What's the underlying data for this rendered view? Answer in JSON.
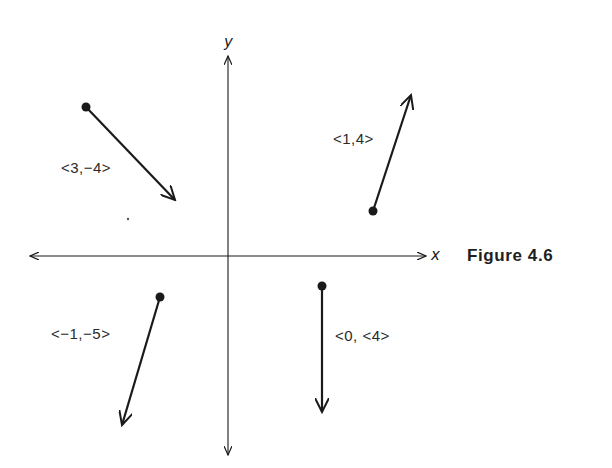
{
  "figure": {
    "caption": "Figure 4.6",
    "axes": {
      "x_label": "x",
      "y_label": "y"
    },
    "vectors": [
      {
        "label": "<3,−4>",
        "tail": [
          86,
          107
        ],
        "head": [
          175,
          200
        ],
        "quadrant": "II"
      },
      {
        "label": "<1,4>",
        "tail": [
          373,
          211
        ],
        "head": [
          411,
          95
        ],
        "quadrant": "I"
      },
      {
        "label": "<−1,−5>",
        "tail": [
          160,
          297
        ],
        "head": [
          122,
          425
        ],
        "quadrant": "III"
      },
      {
        "label": "<0, <4>",
        "tail": [
          322,
          286
        ],
        "head": [
          322,
          412
        ],
        "quadrant": "IV"
      }
    ],
    "colors": {
      "ink": "#1a1a1a",
      "background": "#ffffff"
    }
  }
}
